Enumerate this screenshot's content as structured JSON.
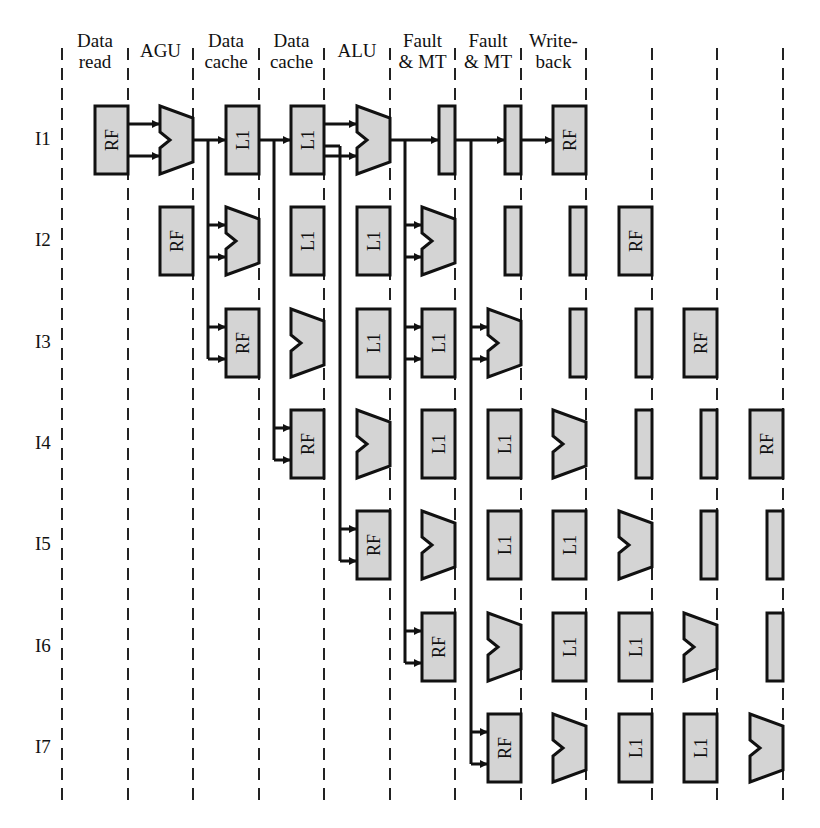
{
  "diagram": {
    "stage_headers": [
      {
        "id": "data-read",
        "line1": "Data",
        "line2": "read"
      },
      {
        "id": "agu",
        "line1": "",
        "line2": "AGU"
      },
      {
        "id": "data-cache-1",
        "line1": "Data",
        "line2": "cache"
      },
      {
        "id": "data-cache-2",
        "line1": "Data",
        "line2": "cache"
      },
      {
        "id": "alu",
        "line1": "",
        "line2": "ALU"
      },
      {
        "id": "fault-mt-1",
        "line1": "Fault",
        "line2": "& MT"
      },
      {
        "id": "fault-mt-2",
        "line1": "Fault",
        "line2": "& MT"
      },
      {
        "id": "write-back",
        "line1": "Write-",
        "line2": "back"
      }
    ],
    "instructions": [
      "I1",
      "I2",
      "I3",
      "I4",
      "I5",
      "I6",
      "I7"
    ],
    "pipeline_sequence": [
      "RF",
      "ALU",
      "L1",
      "L1",
      "ALU",
      "REG",
      "REG",
      "RF"
    ],
    "block_labels": {
      "RF": "RF",
      "L1": "L1"
    },
    "column_boundaries_x": [
      62,
      128,
      193,
      259,
      324,
      390,
      455,
      521,
      586,
      652,
      717,
      783
    ],
    "row_centers_y": [
      140,
      241,
      343,
      444,
      545,
      647,
      748
    ],
    "colors": {
      "block_fill": "#d4d4d4",
      "stroke": "#111111",
      "dash": "#222222",
      "background": "#ffffff"
    },
    "forwarding": [
      {
        "from_instruction": "I1",
        "from_stage": 1,
        "to_instructions": [
          "I2",
          "I3"
        ],
        "branch_x": 208
      },
      {
        "from_instruction": "I1",
        "from_stage": 2,
        "to_instructions": [
          "I4"
        ],
        "branch_x": 274
      },
      {
        "from_instruction": "I1",
        "from_stage": 3,
        "to_instructions": [
          "I5"
        ],
        "branch_x": 340
      },
      {
        "from_instruction": "I1",
        "from_stage": 4,
        "to_instructions": [
          "I2",
          "I3",
          "I6"
        ],
        "branch_x": 405
      },
      {
        "from_instruction": "I1",
        "from_stage": 5,
        "to_instructions": [
          "I3",
          "I7"
        ],
        "branch_x": 471
      }
    ]
  }
}
